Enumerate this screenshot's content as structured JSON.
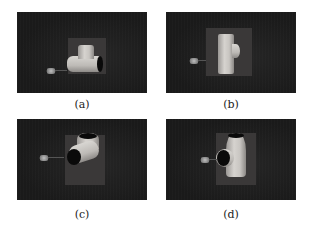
{
  "figure": {
    "panels": [
      {
        "id": "a",
        "caption": "(a)",
        "description": "Rendered scene: T-pipe fitting lying horizontally on dark plate with gripper at left"
      },
      {
        "id": "b",
        "caption": "(b)",
        "description": "Rendered scene: T-pipe fitting upright, side view against plate"
      },
      {
        "id": "c",
        "caption": "(c)",
        "description": "Rendered scene: T-pipe fitting rotated, open end facing viewer"
      },
      {
        "id": "d",
        "caption": "(d)",
        "description": "Rendered scene: T-pipe fitting upright with open end facing viewer"
      }
    ]
  },
  "colors": {
    "background": "#ffffff",
    "panel_bg": "#1c1c1c",
    "pipe": "#cfccc8",
    "plate": "#3a3838"
  }
}
